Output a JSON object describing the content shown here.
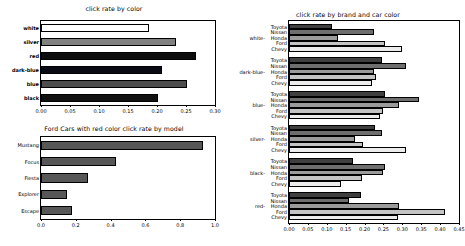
{
  "figure": {
    "background": "#ffffff",
    "width": 464,
    "height": 246
  },
  "chart_data": [
    {
      "id": "click-rate-by-color",
      "type": "bar",
      "orientation": "horizontal",
      "title": "click rate by color",
      "xlabel": "",
      "ylabel": "",
      "categories": [
        "white",
        "silver",
        "red",
        "dark-blue",
        "blue",
        "black"
      ],
      "values": [
        0.187,
        0.233,
        0.268,
        0.208,
        0.252,
        0.202
      ],
      "bar_colors": [
        "#ffffff",
        "#808080",
        "#0d0d0d",
        "#0a0a14",
        "#4d4d4d",
        "#111111"
      ],
      "bar_edge_color": "#000000",
      "xlim": [
        0.0,
        0.3
      ],
      "xticks": [
        "0.00",
        "0.05",
        "0.10",
        "0.15",
        "0.20",
        "0.25",
        "0.30"
      ],
      "xtick_values": [
        0.0,
        0.05,
        0.1,
        0.15,
        0.2,
        0.25,
        0.3
      ],
      "grid": false,
      "legend": "none"
    },
    {
      "id": "ford-red-by-model",
      "type": "bar",
      "orientation": "horizontal",
      "title": "Ford Cars with red color click rate by model",
      "xlabel": "",
      "ylabel": "",
      "categories": [
        "Mustang",
        "Focus",
        "Fiesta",
        "Explorer",
        "Escape"
      ],
      "values": [
        0.93,
        0.43,
        0.27,
        0.15,
        0.18
      ],
      "bar_colors": [
        "#575757",
        "#575757",
        "#575757",
        "#575757",
        "#575757"
      ],
      "bar_edge_color": "#000000",
      "xlim": [
        0.0,
        1.0
      ],
      "xticks": [
        "0.0",
        "0.2",
        "0.4",
        "0.6",
        "0.8",
        "1.0"
      ],
      "xtick_values": [
        0.0,
        0.2,
        0.4,
        0.6,
        0.8,
        1.0
      ],
      "grid": false,
      "legend": "none"
    },
    {
      "id": "click-rate-by-brand-and-color",
      "type": "bar",
      "orientation": "horizontal",
      "title": "click rate by brand and car color",
      "xlabel": "",
      "ylabel": "",
      "groups": [
        "white",
        "dark-blue",
        "blue",
        "silver",
        "black",
        "red"
      ],
      "brands": [
        "Toyota",
        "Nissan",
        "Honda",
        "Ford",
        "Chevy"
      ],
      "brand_colors": [
        "#3f3f3f",
        "#6e6e6e",
        "#9b9b9b",
        "#c4c4c4",
        "#ececec"
      ],
      "bar_edge_color": "#000000",
      "series": [
        {
          "name": "white",
          "values": [
            0.115,
            0.225,
            0.13,
            0.255,
            0.3
          ]
        },
        {
          "name": "dark-blue",
          "values": [
            0.245,
            0.31,
            0.225,
            0.23,
            0.22
          ]
        },
        {
          "name": "blue",
          "values": [
            0.255,
            0.345,
            0.29,
            0.25,
            0.24
          ]
        },
        {
          "name": "silver",
          "values": [
            0.228,
            0.245,
            0.175,
            0.195,
            0.31
          ]
        },
        {
          "name": "black",
          "values": [
            0.17,
            0.253,
            0.248,
            0.192,
            0.138
          ]
        },
        {
          "name": "red",
          "values": [
            0.19,
            0.16,
            0.29,
            0.412,
            0.288
          ]
        }
      ],
      "xlim": [
        0.0,
        0.45
      ],
      "xticks": [
        "0.00",
        "0.05",
        "0.10",
        "0.15",
        "0.20",
        "0.25",
        "0.30",
        "0.35",
        "0.40",
        "0.45"
      ],
      "xtick_values": [
        0.0,
        0.05,
        0.1,
        0.15,
        0.2,
        0.25,
        0.3,
        0.35,
        0.4,
        0.45
      ],
      "grid": false,
      "legend": "none"
    }
  ]
}
